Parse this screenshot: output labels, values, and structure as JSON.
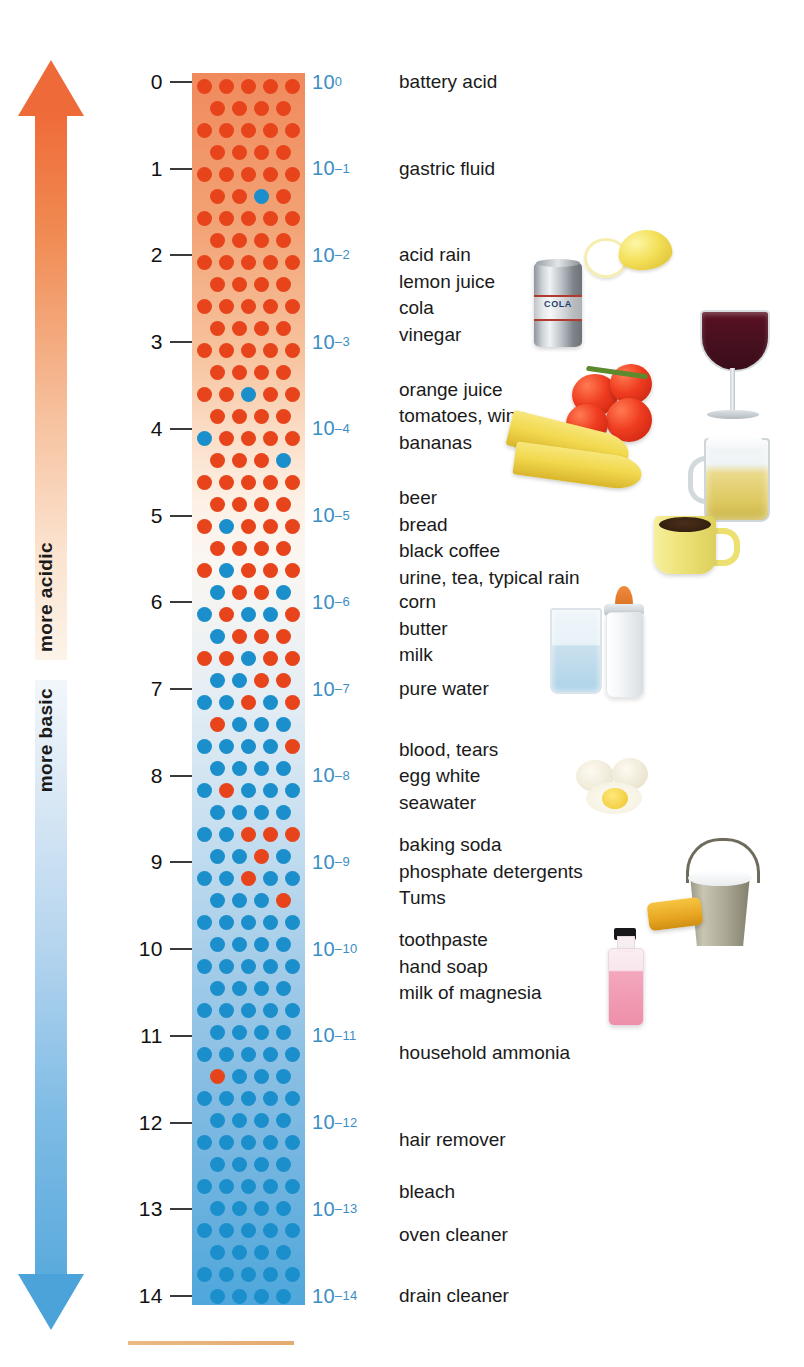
{
  "axis": {
    "arrows": [
      {
        "id": "more-acidic",
        "label": "more acidic",
        "direction": "up",
        "color": "#ee6a38"
      },
      {
        "id": "more-basic",
        "label": "more basic",
        "direction": "down",
        "color": "#4ca3da"
      }
    ],
    "ph_values": [
      "0",
      "1",
      "2",
      "3",
      "4",
      "5",
      "6",
      "7",
      "8",
      "9",
      "10",
      "11",
      "12",
      "13",
      "14"
    ],
    "exponent_base": "10",
    "exponents": [
      "0",
      "–1",
      "–2",
      "–3",
      "–4",
      "–5",
      "–6",
      "–7",
      "–8",
      "–9",
      "–10",
      "–11",
      "–12",
      "–13",
      "–14"
    ],
    "exponent_color": "#3b8ec4"
  },
  "column": {
    "acid_dot_color": "#e8441b",
    "base_dot_color": "#1b8fcc",
    "top_color": "#f08a5d",
    "bottom_color": "#4ea7db",
    "neutral_color": "#f3f4f3"
  },
  "substances": [
    {
      "ph": 0,
      "lines": [
        "battery acid"
      ]
    },
    {
      "ph": 1,
      "lines": [
        "gastric fluid"
      ]
    },
    {
      "ph": 2,
      "lines": [
        "acid rain",
        "lemon juice",
        "cola",
        "vinegar"
      ]
    },
    {
      "ph": 3.55,
      "lines": [
        "orange juice",
        "tomatoes, wine",
        "bananas"
      ]
    },
    {
      "ph": 4.8,
      "lines": [
        "beer",
        "bread",
        "black coffee",
        "urine, tea, typical rain"
      ]
    },
    {
      "ph": 6,
      "lines": [
        "corn",
        "butter",
        "milk"
      ]
    },
    {
      "ph": 7,
      "lines": [
        "pure water"
      ]
    },
    {
      "ph": 7.7,
      "lines": [
        "blood, tears",
        "egg white",
        "seawater"
      ]
    },
    {
      "ph": 8.8,
      "lines": [
        "baking soda",
        "phosphate detergents",
        "Tums"
      ]
    },
    {
      "ph": 9.9,
      "lines": [
        "toothpaste",
        "hand soap",
        "milk of magnesia"
      ]
    },
    {
      "ph": 11.2,
      "lines": [
        "household ammonia"
      ]
    },
    {
      "ph": 12.2,
      "lines": [
        "hair remover"
      ]
    },
    {
      "ph": 12.8,
      "lines": [
        "bleach"
      ]
    },
    {
      "ph": 13.3,
      "lines": [
        "oven cleaner"
      ]
    },
    {
      "ph": 14,
      "lines": [
        "drain cleaner"
      ]
    }
  ],
  "illustrations": [
    {
      "name": "cola-can",
      "caption": "COLA"
    },
    {
      "name": "lemon"
    },
    {
      "name": "wine-glass"
    },
    {
      "name": "tomatoes"
    },
    {
      "name": "bananas"
    },
    {
      "name": "beer-mug"
    },
    {
      "name": "coffee-cup"
    },
    {
      "name": "water-glass"
    },
    {
      "name": "baby-bottle"
    },
    {
      "name": "eggs"
    },
    {
      "name": "bucket-with-sponge"
    },
    {
      "name": "pink-bottle"
    }
  ],
  "chart_data": {
    "type": "bar",
    "xlabel": "",
    "ylabel": "pH",
    "ylim": [
      0,
      14
    ],
    "categories": [
      "0",
      "1",
      "2",
      "3",
      "4",
      "5",
      "6",
      "7",
      "8",
      "9",
      "10",
      "11",
      "12",
      "13",
      "14"
    ],
    "values": [
      1,
      0.1,
      0.01,
      0.001,
      0.0001,
      1e-05,
      1e-06,
      1e-07,
      1e-08,
      1e-09,
      1e-10,
      1e-11,
      1e-12,
      1e-13,
      1e-14
    ],
    "series": [
      {
        "name": "hydrogen ion concentration (mol/L)",
        "values": [
          "10^0",
          "10^-1",
          "10^-2",
          "10^-3",
          "10^-4",
          "10^-5",
          "10^-6",
          "10^-7",
          "10^-8",
          "10^-9",
          "10^-10",
          "10^-11",
          "10^-12",
          "10^-13",
          "10^-14"
        ]
      }
    ],
    "annotations": [
      "battery acid",
      "gastric fluid",
      "acid rain",
      "lemon juice",
      "cola",
      "vinegar",
      "orange juice",
      "tomatoes, wine",
      "bananas",
      "beer",
      "bread",
      "black coffee",
      "urine, tea, typical rain",
      "corn",
      "butter",
      "milk",
      "pure water",
      "blood, tears",
      "egg white",
      "seawater",
      "baking soda",
      "phosphate detergents",
      "Tums",
      "toothpaste",
      "hand soap",
      "milk of magnesia",
      "household ammonia",
      "hair remover",
      "bleach",
      "oven cleaner",
      "drain cleaner"
    ],
    "grid": false,
    "legend": "none"
  }
}
